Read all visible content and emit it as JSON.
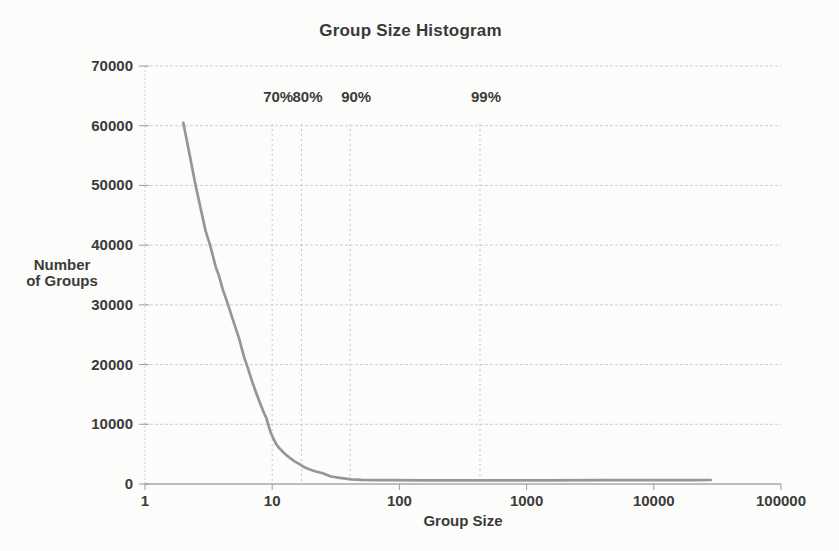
{
  "page": {
    "background": "#fcfcfa"
  },
  "colors": {
    "curve": "#969696",
    "gridline": "#cecece",
    "axis_line": "#a9a9a9",
    "tick": "#9d9d9d",
    "percentile_line": "#c4c4c4",
    "text": "#3b3b3b"
  },
  "chart_data": {
    "type": "line",
    "title": "Group Size Histogram",
    "xlabel": "Group Size",
    "ylabel": "Number of Groups",
    "ylabel_lines": [
      "Number",
      "of Groups"
    ],
    "x_scale": "log",
    "xlim": [
      1,
      100000
    ],
    "ylim": [
      0,
      70000
    ],
    "x_ticks": [
      1,
      10,
      100,
      1000,
      10000,
      100000
    ],
    "y_ticks": [
      0,
      10000,
      20000,
      30000,
      40000,
      50000,
      60000,
      70000
    ],
    "grid": "horizontal dotted gridlines at y ticks; vertical dashed lines only at percentile markers",
    "legend": "none",
    "percentile_markers": [
      {
        "label": "70%",
        "group_size": 10
      },
      {
        "label": "80%",
        "group_size": 17
      },
      {
        "label": "90%",
        "group_size": 41
      },
      {
        "label": "99%",
        "group_size": 430
      }
    ],
    "series": [
      {
        "name": "number-of-groups",
        "points": [
          [
            2,
            60500
          ],
          [
            2.2,
            56000
          ],
          [
            2.5,
            50000
          ],
          [
            2.8,
            45200
          ],
          [
            3,
            42300
          ],
          [
            3.25,
            40000
          ],
          [
            3.6,
            36300
          ],
          [
            3.8,
            35000
          ],
          [
            4.1,
            32500
          ],
          [
            4.5,
            30000
          ],
          [
            5,
            27000
          ],
          [
            5.5,
            24300
          ],
          [
            6,
            21300
          ],
          [
            6.3,
            20000
          ],
          [
            7,
            17000
          ],
          [
            7.5,
            15200
          ],
          [
            8,
            13600
          ],
          [
            8.5,
            12200
          ],
          [
            9,
            11000
          ],
          [
            9.3,
            10000
          ],
          [
            9.7,
            8700
          ],
          [
            10.2,
            7650
          ],
          [
            10.8,
            6600
          ],
          [
            11.5,
            5900
          ],
          [
            12.5,
            5100
          ],
          [
            13.5,
            4500
          ],
          [
            15,
            3800
          ],
          [
            16.5,
            3300
          ],
          [
            18.1,
            2750
          ],
          [
            20,
            2400
          ],
          [
            22,
            2100
          ],
          [
            25,
            1800
          ],
          [
            29,
            1250
          ],
          [
            33,
            1050
          ],
          [
            38,
            880
          ],
          [
            42,
            780
          ],
          [
            50,
            700
          ],
          [
            65,
            660
          ],
          [
            90,
            640
          ],
          [
            150,
            620
          ],
          [
            300,
            610
          ],
          [
            700,
            610
          ],
          [
            1500,
            620
          ],
          [
            4000,
            630
          ],
          [
            10000,
            645
          ],
          [
            20000,
            660
          ],
          [
            28000,
            670
          ]
        ]
      }
    ]
  }
}
